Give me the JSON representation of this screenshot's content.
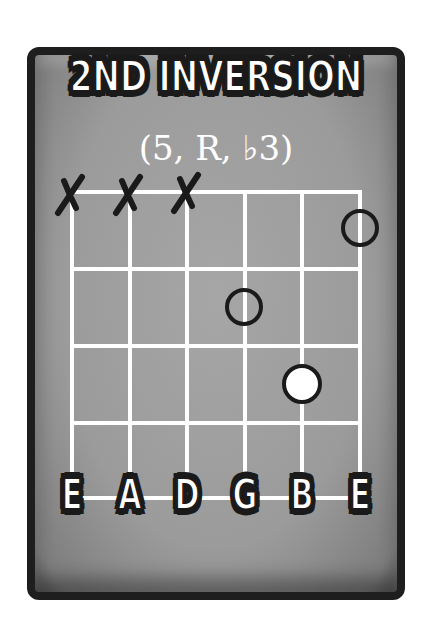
{
  "card": {
    "title": "2ND INVERSION",
    "subtitle": "(5, R, ♭3)",
    "colors": {
      "background": "#9e9e9e",
      "border": "#1e1e1e",
      "grid_lines": "#ffffff",
      "text": "#ffffff",
      "outline": "#1a1a1a"
    }
  },
  "chord": {
    "strings": [
      "E",
      "A",
      "D",
      "G",
      "B",
      "E"
    ],
    "fret_count": 4,
    "muted_strings": [
      "E",
      "A",
      "D"
    ],
    "markers": [
      {
        "string": "E",
        "string_index": 5,
        "fret": 1,
        "style": "open-ring",
        "interval": "5"
      },
      {
        "string": "G",
        "string_index": 3,
        "fret": 2,
        "style": "open-ring",
        "interval": "R"
      },
      {
        "string": "B",
        "string_index": 4,
        "fret": 3,
        "style": "filled-white",
        "interval": "♭3"
      }
    ],
    "mute_symbol": "X"
  }
}
